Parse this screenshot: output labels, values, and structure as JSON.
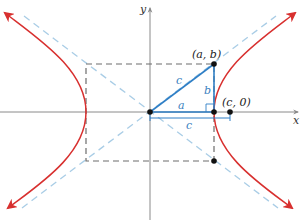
{
  "diagram": {
    "colors": {
      "hyperbola": "#d8302f",
      "asymptote": "#a9cde6",
      "box": "#6d6d6d",
      "triangle": "#2f7fc6",
      "axis": "#8a8a8a",
      "point": "#111111",
      "label_blue": "#3a7fc0",
      "label_dark": "#222222"
    },
    "axes": {
      "x_label": "x",
      "y_label": "y"
    },
    "points": {
      "vertex_top": "(a, b)",
      "focus": "(c, 0)"
    },
    "segments": {
      "hypotenuse": "c",
      "vertical_leg": "b",
      "horizontal_leg": "a",
      "focal_distance": "c"
    }
  }
}
